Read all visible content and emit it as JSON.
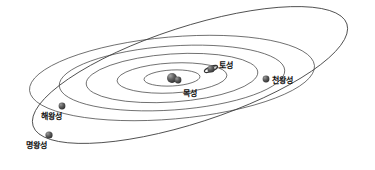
{
  "figure": {
    "kind": "solar-system-orbit-diagram",
    "background_color": "#ffffff",
    "orbit_line_color": "#3a3a3a",
    "planet_body_color": "#4a4a4a",
    "label_color": "#111111"
  },
  "planets": [
    {
      "id": "jupiter",
      "label": "목성",
      "body": {
        "cx": 178,
        "cy": 80,
        "r": 3.4
      },
      "label_pos": {
        "x": 183,
        "y": 90
      },
      "has_rings": false
    },
    {
      "id": "saturn",
      "label": "토성",
      "body": {
        "cx": 211,
        "cy": 69,
        "r": 3.6
      },
      "label_pos": {
        "x": 219,
        "y": 62
      },
      "has_rings": true
    },
    {
      "id": "uranus",
      "label": "천왕성",
      "body": {
        "cx": 266,
        "cy": 79,
        "r": 3.4
      },
      "label_pos": {
        "x": 272,
        "y": 77
      },
      "has_rings": false
    },
    {
      "id": "neptune",
      "label": "해왕성",
      "body": {
        "cx": 62,
        "cy": 106,
        "r": 3.4
      },
      "label_pos": {
        "x": 41,
        "y": 113
      },
      "has_rings": false
    },
    {
      "id": "pluto",
      "label": "명왕성",
      "body": {
        "cx": 49,
        "cy": 135,
        "r": 3.6
      },
      "label_pos": {
        "x": 26,
        "y": 142
      },
      "has_rings": false
    }
  ],
  "sun": {
    "id": "sun",
    "body": {
      "cx": 172,
      "cy": 78,
      "r": 5.0
    }
  },
  "orbits": [
    {
      "id": "orbit-1",
      "rx": 28,
      "ry": 8,
      "cx": 172,
      "cy": 78,
      "rotate": -3
    },
    {
      "id": "orbit-2",
      "rx": 55,
      "ry": 15,
      "cx": 172,
      "cy": 78,
      "rotate": -3
    },
    {
      "id": "orbit-3",
      "rx": 86,
      "ry": 24,
      "cx": 172,
      "cy": 78,
      "rotate": -4
    },
    {
      "id": "orbit-4",
      "rx": 113,
      "ry": 32,
      "cx": 172,
      "cy": 78,
      "rotate": -4
    },
    {
      "id": "orbit-5",
      "rx": 143,
      "ry": 41,
      "cx": 172,
      "cy": 78,
      "rotate": -5
    }
  ],
  "inclined_orbit": {
    "id": "pluto-orbit",
    "rx": 165,
    "ry": 48,
    "cx": 190,
    "cy": 75,
    "rotate": -18
  }
}
